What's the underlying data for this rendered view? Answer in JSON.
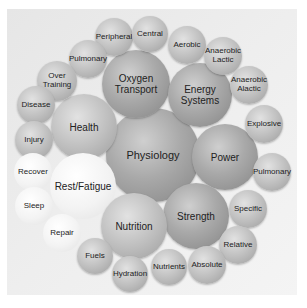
{
  "diagram": {
    "center": "Physiology",
    "nodes": [
      {
        "id": "physiology",
        "label": "Physiology",
        "x": 153,
        "y": 155,
        "r": 47,
        "tone": "dark",
        "size": 11
      },
      {
        "id": "oxygen",
        "label": "Oxygen\nTransport",
        "x": 136,
        "y": 84,
        "r": 34,
        "tone": "dark",
        "size": 10
      },
      {
        "id": "energy",
        "label": "Energy\nSystems",
        "x": 200,
        "y": 95,
        "r": 32,
        "tone": "dark",
        "size": 10
      },
      {
        "id": "health",
        "label": "Health",
        "x": 84,
        "y": 127,
        "r": 33,
        "tone": "mid",
        "size": 10
      },
      {
        "id": "power",
        "label": "Power",
        "x": 225,
        "y": 157,
        "r": 33,
        "tone": "dark",
        "size": 10
      },
      {
        "id": "rest",
        "label": "Rest/Fatigue",
        "x": 83,
        "y": 186,
        "r": 33,
        "tone": "light",
        "size": 10
      },
      {
        "id": "strength",
        "label": "Strength",
        "x": 196,
        "y": 216,
        "r": 33,
        "tone": "dark",
        "size": 10
      },
      {
        "id": "nutrition",
        "label": "Nutrition",
        "x": 134,
        "y": 226,
        "r": 33,
        "tone": "mid",
        "size": 10
      },
      {
        "id": "peripheral",
        "label": "Peripheral",
        "x": 114,
        "y": 37,
        "r": 19,
        "tone": "mid",
        "size": 8
      },
      {
        "id": "central",
        "label": "Central",
        "x": 150,
        "y": 34,
        "r": 18,
        "tone": "mid",
        "size": 8
      },
      {
        "id": "pulmonary1",
        "label": "Pulmonary",
        "x": 88,
        "y": 59,
        "r": 19,
        "tone": "mid",
        "size": 8
      },
      {
        "id": "overtraining",
        "label": "Over\nTraining",
        "x": 57,
        "y": 81,
        "r": 20,
        "tone": "mid",
        "size": 8
      },
      {
        "id": "disease",
        "label": "Disease",
        "x": 36,
        "y": 105,
        "r": 19,
        "tone": "mid",
        "size": 8
      },
      {
        "id": "injury",
        "label": "Injury",
        "x": 34,
        "y": 140,
        "r": 19,
        "tone": "mid",
        "size": 8
      },
      {
        "id": "aerobic",
        "label": "Aerobic",
        "x": 187,
        "y": 45,
        "r": 19,
        "tone": "mid",
        "size": 8
      },
      {
        "id": "anaerobic_lactic",
        "label": "Anaerobic\nLactic",
        "x": 223,
        "y": 56,
        "r": 19,
        "tone": "mid",
        "size": 8
      },
      {
        "id": "anaerobic_alactic",
        "label": "Anaerobic\nAlactic",
        "x": 249,
        "y": 85,
        "r": 19,
        "tone": "mid",
        "size": 8
      },
      {
        "id": "explosive",
        "label": "Explosive",
        "x": 264,
        "y": 124,
        "r": 19,
        "tone": "mid",
        "size": 8
      },
      {
        "id": "pulmonary2",
        "label": "Pulmonary",
        "x": 272,
        "y": 172,
        "r": 19,
        "tone": "mid",
        "size": 8
      },
      {
        "id": "specific",
        "label": "Specific",
        "x": 248,
        "y": 209,
        "r": 19,
        "tone": "mid",
        "size": 8
      },
      {
        "id": "relative",
        "label": "Relative",
        "x": 238,
        "y": 245,
        "r": 19,
        "tone": "mid",
        "size": 8
      },
      {
        "id": "absolute",
        "label": "Absolute",
        "x": 207,
        "y": 265,
        "r": 19,
        "tone": "mid",
        "size": 8
      },
      {
        "id": "nutrients",
        "label": "Nutrients",
        "x": 169,
        "y": 267,
        "r": 18,
        "tone": "mid",
        "size": 8
      },
      {
        "id": "hydration",
        "label": "Hydration",
        "x": 130,
        "y": 274,
        "r": 18,
        "tone": "mid",
        "size": 8
      },
      {
        "id": "fuels",
        "label": "Fuels",
        "x": 95,
        "y": 256,
        "r": 18,
        "tone": "mid",
        "size": 8
      },
      {
        "id": "recover",
        "label": "Recover",
        "x": 33,
        "y": 172,
        "r": 19,
        "tone": "light",
        "size": 8
      },
      {
        "id": "sleep",
        "label": "Sleep",
        "x": 34,
        "y": 206,
        "r": 19,
        "tone": "light",
        "size": 8
      },
      {
        "id": "repair",
        "label": "Repair",
        "x": 62,
        "y": 233,
        "r": 19,
        "tone": "light",
        "size": 8
      }
    ]
  }
}
